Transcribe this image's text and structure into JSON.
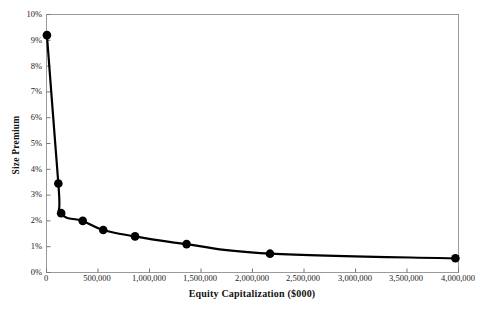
{
  "chart_data": {
    "type": "line",
    "title": "",
    "xlabel": "Equity Capitalization ($000)",
    "ylabel": "Size Premium",
    "xlim": [
      0,
      4000000
    ],
    "ylim": [
      0,
      0.1
    ],
    "grid": false,
    "legend": "none",
    "x_ticks": [
      "0",
      "500,000",
      "1,000,000",
      "1,500,000",
      "2,000,000",
      "2,500,000",
      "3,000,000",
      "3,500,000",
      "4,000,000"
    ],
    "x_tick_values": [
      0,
      500000,
      1000000,
      1500000,
      2000000,
      2500000,
      3000000,
      3500000,
      4000000
    ],
    "y_ticks": [
      "0%",
      "1%",
      "2%",
      "3%",
      "4%",
      "5%",
      "6%",
      "7%",
      "8%",
      "9%",
      "10%"
    ],
    "y_tick_values": [
      0,
      1,
      2,
      3,
      4,
      5,
      6,
      7,
      8,
      9,
      10
    ],
    "series": [
      {
        "name": "Size Premium",
        "marker": "circle",
        "color": "#000000",
        "x": [
          4000,
          115000,
          142000,
          352000,
          551000,
          860000,
          1360000,
          2170000,
          3970000
        ],
        "y": [
          9.2,
          3.45,
          2.3,
          2.0,
          1.65,
          1.4,
          1.1,
          0.73,
          0.55
        ]
      }
    ]
  },
  "axes": {
    "border_color": "#999999",
    "tick_color": "#777777"
  }
}
